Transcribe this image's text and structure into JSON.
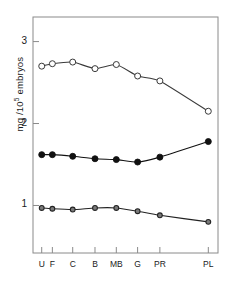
{
  "chart_data": {
    "type": "line",
    "title": "",
    "subtitle": "",
    "xlabel": "",
    "ylabel": "mg /10⁵ embryos",
    "ylabel_base": "mg /10",
    "ylabel_exp": "5",
    "ylabel_tail": " embryos",
    "categories": [
      "U",
      "F",
      "C",
      "B",
      "MB",
      "G",
      "PR",
      "PL"
    ],
    "x_positions": [
      0.0,
      0.55,
      1.6,
      2.75,
      3.85,
      4.95,
      6.1,
      8.6
    ],
    "xlim": [
      -0.45,
      9.1
    ],
    "ylim": [
      0.42,
      3.3
    ],
    "yticks": [
      1,
      2,
      3
    ],
    "ytick_labels": [
      "1",
      "2",
      "3"
    ],
    "grid": false,
    "legend": "none",
    "frame": "box",
    "series": [
      {
        "name": "open-circle-series",
        "marker": "open-circle",
        "color": "#3a3a3a",
        "fill": "#ffffff",
        "values": [
          2.7,
          2.73,
          2.75,
          2.67,
          2.72,
          2.58,
          2.52,
          2.15
        ]
      },
      {
        "name": "filled-circle-series",
        "marker": "filled-circle",
        "color": "#111111",
        "fill": "#111111",
        "values": [
          1.62,
          1.62,
          1.6,
          1.57,
          1.56,
          1.53,
          1.59,
          1.78
        ]
      },
      {
        "name": "small-circle-series",
        "marker": "small-circle",
        "color": "#222222",
        "fill": "#7a7a7a",
        "values": [
          0.97,
          0.96,
          0.95,
          0.97,
          0.97,
          0.93,
          0.88,
          0.8
        ]
      }
    ]
  },
  "figure": {
    "background": "#ffffff",
    "axis_color": "#8a8a8a",
    "text_color": "#1a1a1a"
  }
}
